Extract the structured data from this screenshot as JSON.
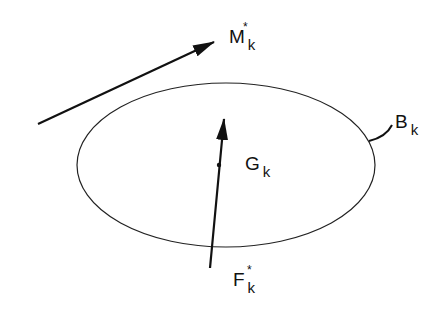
{
  "diagram": {
    "type": "rigid body free-body diagram",
    "elements": [
      {
        "id": "body",
        "shape": "ellipse",
        "label": "B",
        "subscript": "k"
      },
      {
        "id": "center",
        "shape": "point",
        "label": "G",
        "subscript": "k"
      },
      {
        "id": "force",
        "shape": "arrow",
        "label": "F",
        "subscript": "k",
        "superscript": "*"
      },
      {
        "id": "moment",
        "shape": "arrow",
        "label": "M",
        "subscript": "k",
        "superscript": "*"
      }
    ]
  },
  "labels": {
    "moment": {
      "main": "M",
      "sub": "k",
      "sup": "*"
    },
    "body": {
      "main": "B",
      "sub": "k"
    },
    "center": {
      "main": "G",
      "sub": "k"
    },
    "force": {
      "main": "F",
      "sub": "k",
      "sup": "*"
    }
  },
  "colors": {
    "stroke": "#111111",
    "background": "#ffffff"
  }
}
